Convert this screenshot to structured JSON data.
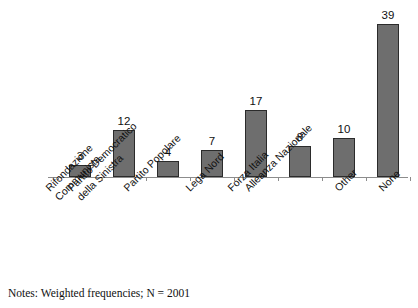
{
  "chart_data": {
    "type": "bar",
    "title": "",
    "subtitle": "",
    "xlabel": "",
    "ylabel": "",
    "ylim": [
      0,
      42
    ],
    "grid": false,
    "legend": "none",
    "orientation": "vertical",
    "bar_color": "#6e6e6e",
    "bar_border_color": "#2b2b2b",
    "axis_color": "#8c8c8c",
    "value_labels_shown": true,
    "categories": [
      "Rifondazione Communista",
      "Partito Democratico della Sinistra",
      "Partito Popolare",
      "Lega Nord",
      "Forza Italia",
      "Alleanza Nazionale",
      "Other",
      "None"
    ],
    "category_lines": [
      [
        "Rifondazione",
        "Communista"
      ],
      [
        "Partito Democratico",
        "della Sinistra"
      ],
      [
        "Partito Popolare",
        ""
      ],
      [
        "Lega Nord",
        ""
      ],
      [
        "Forza Italia",
        ""
      ],
      [
        "Alleanza Nazionale",
        ""
      ],
      [
        "Other",
        ""
      ],
      [
        "None",
        ""
      ]
    ],
    "values": [
      3,
      12,
      4,
      7,
      17,
      8,
      10,
      39
    ],
    "value_labels": [
      "3",
      "12",
      "4",
      "7",
      "17",
      "8",
      "10",
      "39"
    ],
    "annotations": [
      "Notes: Weighted frequencies; N = 2001"
    ]
  },
  "notes": {
    "text": "Notes: Weighted frequencies; N = 2001"
  }
}
